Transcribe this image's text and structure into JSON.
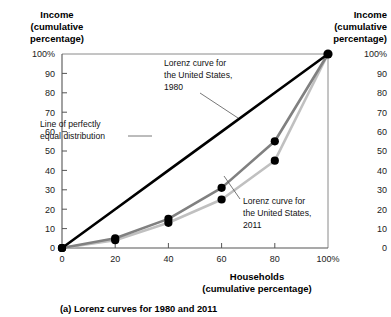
{
  "chart_data": {
    "type": "line",
    "title": "",
    "caption": "(a) Lorenz curves for 1980 and 2011",
    "xlabel": "Households",
    "xlabel_sub": "(cumulative percentage)",
    "ylabel": "Income",
    "ylabel_sub2": "(cumulative",
    "ylabel_sub3": "percentage)",
    "xlim": [
      0,
      100
    ],
    "ylim": [
      0,
      100
    ],
    "grid": false,
    "legend_position": "inline-annotations",
    "x_ticks": [
      "0",
      "20",
      "40",
      "60",
      "80",
      "100%"
    ],
    "x_tick_values": [
      0,
      20,
      40,
      60,
      80,
      100
    ],
    "y_ticks": [
      "0",
      "10",
      "20",
      "30",
      "40",
      "50",
      "60",
      "70",
      "80",
      "90",
      "100%"
    ],
    "y_tick_values": [
      0,
      10,
      20,
      30,
      40,
      50,
      60,
      70,
      80,
      90,
      100
    ],
    "y_ticks_right": [
      "0",
      "10",
      "20",
      "30",
      "40",
      "50",
      "60",
      "70",
      "80",
      "90",
      "100%"
    ],
    "x": [
      0,
      20,
      40,
      60,
      80,
      100
    ],
    "series": [
      {
        "name": "Line of perfectly equal distribution",
        "values": [
          0,
          20,
          40,
          60,
          80,
          100
        ],
        "color": "#000000",
        "width": 2.6,
        "markers": false
      },
      {
        "name": "Lorenz curve for the United States, 1980",
        "values": [
          0,
          5,
          15,
          31,
          55,
          100
        ],
        "color": "#808080",
        "width": 2.6,
        "markers": true
      },
      {
        "name": "Lorenz curve for the United States, 2011",
        "values": [
          0,
          4,
          13,
          25,
          45,
          100
        ],
        "color": "#c0c0c0",
        "width": 2.6,
        "markers": true
      }
    ],
    "annotations": [
      {
        "name": "annotation-lorenz-1980",
        "lines": [
          "Lorenz curve for",
          "the United States,",
          "1980"
        ]
      },
      {
        "name": "annotation-equal-line",
        "lines": [
          "Line of perfectly",
          "equal distribution"
        ]
      },
      {
        "name": "annotation-lorenz-2011",
        "lines": [
          "Lorenz curve for",
          "the United States,",
          "2011"
        ]
      }
    ]
  },
  "axes": {
    "left_title_line1": "Income",
    "left_title_line2": "(cumulative",
    "left_title_line3": "percentage)",
    "right_title_line1": "Income",
    "right_title_line2": "(cumulative",
    "right_title_line3": "percentage)",
    "bottom_title_line1": "Households",
    "bottom_title_line2": "(cumulative percentage)"
  },
  "caption": {
    "text": "(a) Lorenz curves for 1980 and 2011"
  }
}
